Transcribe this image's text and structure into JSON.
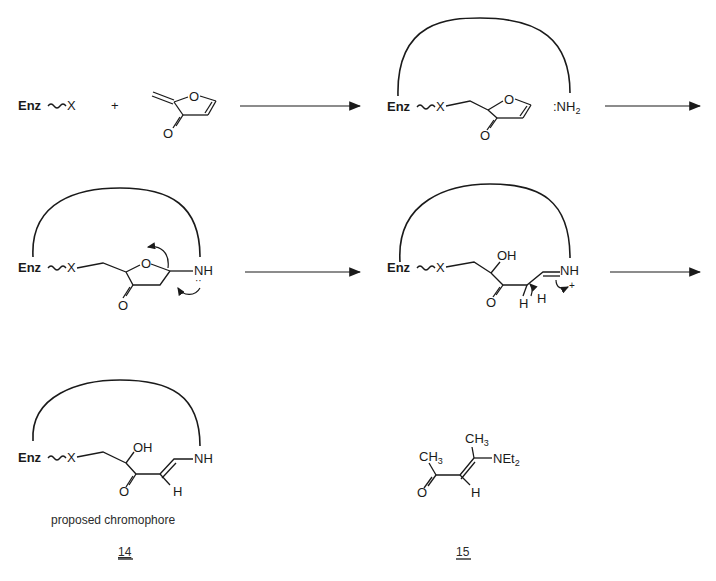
{
  "scheme": {
    "row1": {
      "reactant_enzyme": {
        "enz": "Enz",
        "x": "X"
      },
      "plus": "+",
      "reactant_furanone": {
        "ring_o": "O",
        "carbonyl_o": "O"
      },
      "intermediate1": {
        "enz": "Enz",
        "x": "X",
        "ring_o": "O",
        "carbonyl_o": "O",
        "amine": ":NH",
        "amine_sub": "2"
      }
    },
    "row2": {
      "intermediate2": {
        "enz": "Enz",
        "x": "X",
        "ring_o": "O",
        "carbonyl_o": "O",
        "amine": "NH",
        "lone_pair": "··"
      },
      "intermediate3": {
        "enz": "Enz",
        "x": "X",
        "hydroxyl": "OH",
        "carbonyl_o": "O",
        "h1": "H",
        "h2": "H",
        "iminium": "NH",
        "charge": "+"
      }
    },
    "row3": {
      "compound14": {
        "enz": "Enz",
        "x": "X",
        "hydroxyl": "OH",
        "carbonyl_o": "O",
        "h": "H",
        "amine": "NH",
        "caption": "proposed chromophore",
        "number": "14"
      },
      "compound15": {
        "ch3_a": "CH",
        "ch3_a_sub": "3",
        "ch3_b": "CH",
        "ch3_b_sub": "3",
        "amine": "NEt",
        "amine_sub": "2",
        "carbonyl_o": "O",
        "h": "H",
        "number": "15"
      }
    }
  }
}
